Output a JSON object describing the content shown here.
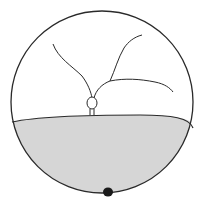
{
  "diagram": {
    "type": "circular-illustration",
    "colors": {
      "background": "#ffffff",
      "stroke": "#2a2a2a",
      "fill_lower": "#d6d6d6",
      "dot": "#1a1a1a"
    },
    "elements": [
      "outer-circle",
      "gray-lower-region",
      "left-curved-line",
      "right-branching-line",
      "small-loop",
      "loop-stem",
      "black-dot"
    ]
  }
}
